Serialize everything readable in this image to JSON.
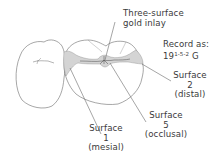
{
  "diagram": {
    "colors": {
      "outline": "#6b6b6b",
      "inlay_fill": "#d4d4d4",
      "text": "#3a3a3a",
      "leader": "#6a6a6a"
    },
    "labels": {
      "inlay": {
        "line1": "Three-surface",
        "line2": "gold inlay"
      },
      "record": {
        "line1": "Record as:",
        "tooth_number": "19",
        "surfaces": "1-5-2",
        "material": "G"
      },
      "surface_distal": {
        "title": "Surface",
        "number": "2",
        "name": "(distal)"
      },
      "surface_occlusal": {
        "title": "Surface",
        "number": "5",
        "name": "(occlusal)"
      },
      "surface_mesial": {
        "title": "Surface",
        "number": "1",
        "name": "(mesial)"
      }
    }
  }
}
